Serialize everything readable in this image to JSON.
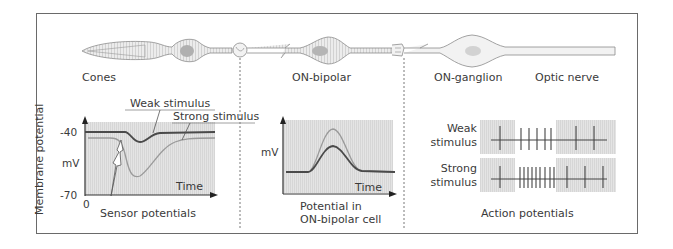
{
  "diagram": {
    "cells": [
      {
        "label": "Cones"
      },
      {
        "label": "ON-bipolar"
      },
      {
        "label": "ON-ganglion"
      },
      {
        "label": "Optic nerve"
      }
    ],
    "colors": {
      "frame": "#6a6a6a",
      "cell_fill": "#e6e6e6",
      "cell_stroke": "#8c8c8c",
      "nucleus": "#b5b5b5",
      "plot_bg": "#e2e2e2",
      "weak_curve": "#4a4a4a",
      "strong_curve": "#9a9a9a"
    },
    "sensor_panel": {
      "y_axis_label": "Membrane potential",
      "y_unit": "mV",
      "y_tick_top": "-40",
      "y_tick_bottom": "-70",
      "x_origin": "0",
      "x_axis_label": "Time",
      "weak_label": "Weak stimulus",
      "strong_label": "Strong stimulus",
      "caption": "Sensor potentials"
    },
    "bipolar_panel": {
      "y_unit": "mV",
      "x_axis_label": "Time",
      "caption_line1": "Potential in",
      "caption_line2": "ON-bipolar cell"
    },
    "action_panel": {
      "row1_line1": "Weak",
      "row1_line2": "stimulus",
      "row2_line1": "Strong",
      "row2_line2": "stimulus",
      "caption": "Action potentials",
      "weak_spike_count_during_stimulus": 5,
      "strong_spike_count_during_stimulus": 9
    }
  }
}
